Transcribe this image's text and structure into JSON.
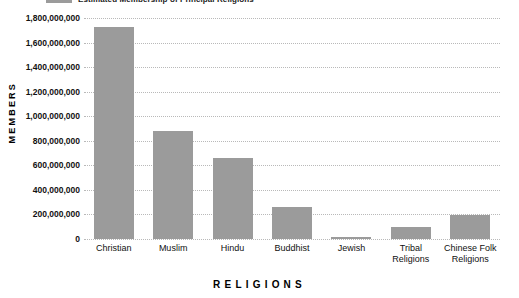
{
  "legend": {
    "label": "Estimated Membership of Principal Religions",
    "swatch_color": "#9b9b9b"
  },
  "axes": {
    "y_title": "MEMBERS",
    "x_title": "RELIGIONS"
  },
  "chart_data": {
    "type": "bar",
    "title": "Estimated Membership of Principal Religions",
    "xlabel": "RELIGIONS",
    "ylabel": "MEMBERS",
    "categories": [
      "Christian",
      "Muslim",
      "Hindu",
      "Buddhist",
      "Jewish",
      "Tribal\nReligions",
      "Chinese Folk\nReligions"
    ],
    "values": [
      1730000000,
      880000000,
      660000000,
      260000000,
      18000000,
      100000000,
      195000000
    ],
    "ylim": [
      0,
      1800000000
    ],
    "ytick_values": [
      1800000000,
      1600000000,
      1400000000,
      1200000000,
      1000000000,
      800000000,
      600000000,
      400000000,
      200000000,
      0
    ],
    "ytick_labels": [
      "1,800,000,000",
      "1,600,000,000",
      "1,400,000,000",
      "1,200,000,000",
      "1,000,000,000",
      "800,000,000",
      "600,000,000",
      "400,000,000",
      "200,000,000",
      "0"
    ],
    "grid": true,
    "grid_style": "dotted",
    "legend_position": "top-left",
    "bar_color": "#9b9b9b"
  }
}
